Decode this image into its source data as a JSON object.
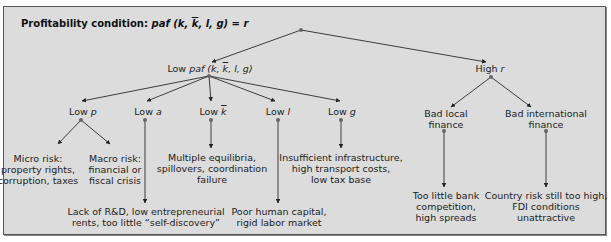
{
  "title": {
    "prefix": "Profitability condition: ",
    "formula": "paf (k, k, l, g) = r"
  },
  "nodes": {
    "low_paf": {
      "text_prefix": "Low ",
      "text_var": "paf",
      "text_args": "(k, k, l, g)"
    },
    "high_r": {
      "text_prefix": "High ",
      "text_var": "r"
    },
    "low_p": {
      "text_prefix": "Low ",
      "text_var": "p"
    },
    "low_a": {
      "text_prefix": "Low ",
      "text_var": "a"
    },
    "low_kbar": {
      "text_prefix": "Low ",
      "text_var": "k"
    },
    "low_l": {
      "text_prefix": "Low ",
      "text_var": "l"
    },
    "low_g": {
      "text_prefix": "Low ",
      "text_var": "g"
    },
    "bad_local_finance": {
      "lines": [
        "Bad local",
        "finance"
      ]
    },
    "bad_international_finance": {
      "lines": [
        "Bad international",
        "finance"
      ]
    }
  },
  "leaves": {
    "micro_risk": {
      "lines": [
        "Micro risk:",
        "property rights,",
        "corruption, taxes"
      ]
    },
    "macro_risk": {
      "lines": [
        "Macro risk:",
        "financial or",
        "fiscal crisis"
      ]
    },
    "lack_rd": {
      "lines": [
        "Lack of R&D, low entrepreneurial",
        "rents, too little “self-discovery”"
      ]
    },
    "multiple_equilibria": {
      "lines": [
        "Multiple equilibria,",
        "spillovers, coordination",
        "failure"
      ]
    },
    "poor_human_capital": {
      "lines": [
        "Poor human capital,",
        "rigid labor market"
      ]
    },
    "insufficient_infrastructure": {
      "lines": [
        "Insufficient infrastructure,",
        "high transport costs,",
        "low tax base"
      ]
    },
    "too_little_bank": {
      "lines": [
        "Too little bank",
        "competition,",
        "high spreads"
      ]
    },
    "country_risk": {
      "lines": [
        "Country risk still too high,",
        "FDI conditions",
        "unattractive"
      ]
    }
  },
  "colors": {
    "background": "#dcdcdc",
    "line": "#2a2a2a",
    "dot": "#666666"
  }
}
